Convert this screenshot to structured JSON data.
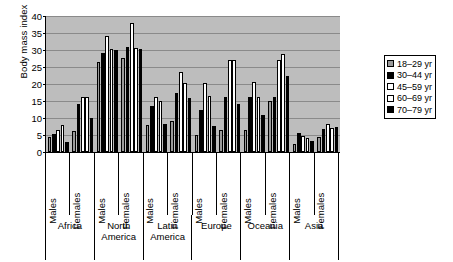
{
  "chart_data": {
    "type": "bar",
    "title": "",
    "xlabel": "",
    "ylabel": "Body mass index",
    "ylim": [
      0,
      40
    ],
    "yticks": [
      0,
      5,
      10,
      15,
      20,
      25,
      30,
      35,
      40
    ],
    "grid": true,
    "legend_position": "right",
    "legend_entries": [
      "18–29 yr",
      "30–44 yr",
      "45–59 yr",
      "60–69 yr",
      "70–79 yr"
    ],
    "series": [
      {
        "name": "18–29 yr",
        "color": "#9a9a9a",
        "values": [
          4.5,
          6.3,
          26.5,
          27.7,
          7.8,
          9.0,
          5.0,
          6.5,
          6.5,
          14.9,
          2.3,
          4.4
        ]
      },
      {
        "name": "30–44 yr",
        "color": "#000000",
        "values": [
          5.3,
          14.0,
          29.0,
          31.0,
          13.6,
          17.3,
          12.5,
          16.2,
          16.2,
          16.2,
          5.6,
          6.8
        ]
      },
      {
        "name": "45–59 yr",
        "color": "#ffffff",
        "values": [
          6.5,
          16.3,
          34.2,
          37.8,
          16.2,
          23.5,
          20.2,
          27.0,
          20.7,
          27.0,
          4.7,
          8.3
        ]
      },
      {
        "name": "60–69 yr",
        "color": "#ffffff",
        "values": [
          7.8,
          16.2,
          30.2,
          30.6,
          15.0,
          20.2,
          16.5,
          27.0,
          16.2,
          28.8,
          4.0,
          7.0
        ]
      },
      {
        "name": "70–79 yr",
        "color": "#000000",
        "values": [
          2.9,
          10.0,
          30.0,
          30.4,
          8.2,
          16.0,
          7.7,
          14.2,
          11.0,
          22.5,
          3.2,
          7.3
        ]
      }
    ],
    "groups": [
      {
        "region": "Africa",
        "sex": "Males"
      },
      {
        "region": "Africa",
        "sex": "Females"
      },
      {
        "region": "North America",
        "sex": "Males"
      },
      {
        "region": "North America",
        "sex": "Females"
      },
      {
        "region": "Latin America",
        "sex": "Males"
      },
      {
        "region": "Latin America",
        "sex": "Females"
      },
      {
        "region": "Europe",
        "sex": "Males"
      },
      {
        "region": "Europe",
        "sex": "Females"
      },
      {
        "region": "Oceania",
        "sex": "Males"
      },
      {
        "region": "Oceania",
        "sex": "Females"
      },
      {
        "region": "Asia",
        "sex": "Males"
      },
      {
        "region": "Asia",
        "sex": "Females"
      }
    ],
    "regions": [
      "Africa",
      "North America",
      "Latin America",
      "Europe",
      "Oceania",
      "Asia"
    ],
    "sex_labels": [
      "Males",
      "Females"
    ]
  },
  "colors": {
    "plot_background": "#bdbdbd",
    "gridline": "#8a8a8a",
    "axis": "#000000",
    "page_background": "#ffffff"
  }
}
